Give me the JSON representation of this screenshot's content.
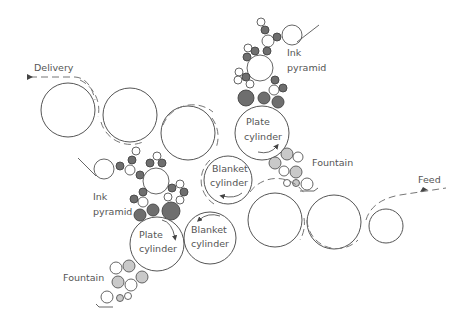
{
  "diagram": {
    "labels": {
      "delivery": "Delivery",
      "feed": "Feed",
      "ink_pyramid_top_1": "Ink",
      "ink_pyramid_top_2": "pyramid",
      "ink_pyramid_bottom_1": "Ink",
      "ink_pyramid_bottom_2": "pyramid",
      "plate_top_1": "Plate",
      "plate_top_2": "cylinder",
      "blanket_top_1": "Blanket",
      "blanket_top_2": "cylinder",
      "plate_bottom_1": "Plate",
      "plate_bottom_2": "cylinder",
      "blanket_bottom_1": "Blanket",
      "blanket_bottom_2": "cylinder",
      "fountain_top": "Fountain",
      "fountain_bottom": "Fountain"
    },
    "colors": {
      "stroke": "#555555",
      "dark_roller": "#6e6e6e",
      "light_roller": "#c9c9c9",
      "text": "#555555"
    }
  }
}
